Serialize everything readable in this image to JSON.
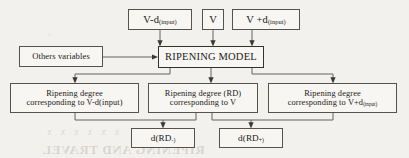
{
  "diagram": {
    "background_color": "#f2f1ee",
    "line_color": "#56524d",
    "text_color": "#1d1a17",
    "nodes": {
      "input_v_minus": {
        "text_main": "V-d",
        "text_sub": "(input)"
      },
      "input_v": {
        "text_main": "V",
        "text_sub": ""
      },
      "input_v_plus": {
        "text_main": "V +d",
        "text_sub": "(input)"
      },
      "others_variables": {
        "text_main": "Others variables"
      },
      "ripening_model": {
        "text_main": "RIPENING MODEL"
      },
      "rd_minus": {
        "line1": "Ripening degree",
        "line2": "corresponding to V-d(input)"
      },
      "rd_mid": {
        "line1": "Ripening degree (RD)",
        "line2": "corresponding to V"
      },
      "rd_plus": {
        "line1": "Ripening degree",
        "line2_main": "corresponding to V+d",
        "line2_sub": "(input)"
      },
      "d_rd_minus": {
        "text_main": "d(RD",
        "text_sub": "-)"
      },
      "d_rd_plus": {
        "text_main": "d(RD",
        "text_sub": "+)"
      }
    },
    "bleed_through": {
      "title": "RIPENING AND TRAVEL",
      "row": "x x x x x x"
    }
  }
}
